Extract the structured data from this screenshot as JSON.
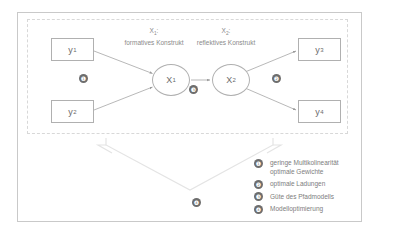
{
  "diagram": {
    "title_present": false,
    "indicators": [
      {
        "id": "y1",
        "label": "y",
        "sub": "1"
      },
      {
        "id": "y2",
        "label": "y",
        "sub": "2"
      },
      {
        "id": "y3",
        "label": "y",
        "sub": "3"
      },
      {
        "id": "y4",
        "label": "y",
        "sub": "4"
      }
    ],
    "latents": [
      {
        "id": "x1",
        "label": "X",
        "sub": "1"
      },
      {
        "id": "x2",
        "label": "X",
        "sub": "2"
      }
    ],
    "construct_labels": [
      {
        "id": "x1",
        "symbol": "X",
        "sub": "1",
        "caption": "formatives Konstrukt"
      },
      {
        "id": "x2",
        "symbol": "X",
        "sub": "2",
        "caption": "reflektives Konstrukt"
      }
    ],
    "markers": [
      {
        "id": "m1",
        "number": "❶"
      },
      {
        "id": "m2",
        "number": "❷"
      },
      {
        "id": "m3",
        "number": "❸"
      },
      {
        "id": "m4",
        "number": "❹"
      }
    ],
    "legend": [
      {
        "number": "❶",
        "text": "geringe Multikolinearität\noptimale Gewichte"
      },
      {
        "number": "❷",
        "text": "optimale Ladungen"
      },
      {
        "number": "❸",
        "text": "Güte des Pfadmodells"
      },
      {
        "number": "❹",
        "text": "Modelloptimierung"
      }
    ],
    "colors": {
      "frame": "#c9c9c9",
      "dashed_frame": "#d8d8d8",
      "node_stroke": "#b0b0b0",
      "arrow": "#9a9a9a",
      "badge_fill": "#6d6d6d",
      "text": "#7d7d7d",
      "big_arrow_stroke": "#e2e2e2"
    }
  }
}
